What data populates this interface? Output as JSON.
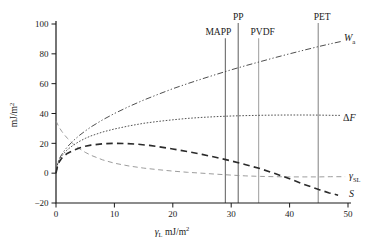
{
  "figure": {
    "background": "#ffffff",
    "axis_color": "#1a1a1a"
  },
  "chart_data": {
    "type": "line",
    "title": "",
    "xlabel": "γL mJ/m2",
    "ylabel": "mJ/m2",
    "xlim": [
      0,
      50
    ],
    "ylim": [
      -20,
      100
    ],
    "grid": false,
    "legend_position": "end-of-curve-labels",
    "x_ticks": {
      "values": [
        0,
        10,
        20,
        30,
        40,
        50
      ],
      "labels": [
        "0",
        "10",
        "20",
        "30",
        "40",
        "50"
      ]
    },
    "y_ticks": {
      "values": [
        100,
        80,
        60,
        40,
        20,
        0,
        -20
      ],
      "labels": [
        "100",
        "80",
        "60",
        "40",
        "20",
        "0",
        "−20"
      ]
    },
    "y_title_parts": [
      {
        "t": "mJ/m",
        "fs": 9.5
      },
      {
        "t": "2",
        "fs": 6.5,
        "dy": -3.5
      }
    ],
    "x_title_parts": [
      {
        "t": "γ",
        "fs": 10,
        "italic": true
      },
      {
        "t": "L",
        "fs": 6.5,
        "dy": 1.5
      },
      {
        "t": " mJ/m",
        "fs": 9.5,
        "dy": -1.5
      },
      {
        "t": "2",
        "fs": 6.5,
        "dy": -4
      }
    ],
    "vertical_lines": [
      {
        "name": "mapp",
        "label": "MAPP",
        "x": 29.0,
        "y_top": 90.5,
        "color": "#6b6b6b",
        "label_dx": -7
      },
      {
        "name": "pp",
        "label": "PP",
        "x": 31.2,
        "y_top": 100.6,
        "color": "#6b6b6b",
        "label_dx": 0
      },
      {
        "name": "pvdf",
        "label": "PVDF",
        "x": 34.7,
        "y_top": 90.5,
        "color": "#a6a6a6",
        "label_dx": 4
      },
      {
        "name": "pet",
        "label": "PET",
        "x": 44.9,
        "y_top": 100.6,
        "color": "#8c8c8c",
        "label_dx": 4
      }
    ],
    "series": [
      {
        "name": "Wa",
        "description": "work of adhesion",
        "color": "#3a3a3a",
        "width": 0.9,
        "dash": "6 2.2 1.3 2.2 1.3 2.2",
        "cap": "butt",
        "label_parts": [
          {
            "t": "W",
            "fs": 10,
            "italic": true
          },
          {
            "t": "a",
            "fs": 7,
            "dy": 2.5
          }
        ],
        "label_x": 344,
        "label_y": 41,
        "points": [
          [
            0,
            0
          ],
          [
            0.3,
            6.9
          ],
          [
            0.6,
            9.8
          ],
          [
            1,
            12.6
          ],
          [
            1.5,
            15.5
          ],
          [
            2,
            17.9
          ],
          [
            3,
            21.9
          ],
          [
            4,
            25.3
          ],
          [
            5,
            28.3
          ],
          [
            6,
            31
          ],
          [
            8,
            35.8
          ],
          [
            10,
            40
          ],
          [
            12.5,
            44.7
          ],
          [
            15,
            49
          ],
          [
            17.5,
            52.9
          ],
          [
            20,
            56.6
          ],
          [
            22.5,
            60
          ],
          [
            25,
            63.2
          ],
          [
            27.5,
            66.3
          ],
          [
            30,
            69.3
          ],
          [
            32.5,
            72.1
          ],
          [
            35,
            74.8
          ],
          [
            37.5,
            77.5
          ],
          [
            40,
            80
          ],
          [
            42.5,
            82.5
          ],
          [
            45,
            84.9
          ],
          [
            47,
            86.7
          ],
          [
            48.8,
            88.3
          ]
        ]
      },
      {
        "name": "ΔF",
        "description": "free energy change",
        "color": "#4a4a4a",
        "width": 0.95,
        "dash": "0.8 2.4",
        "cap": "round",
        "label_parts": [
          {
            "t": "Δ",
            "fs": 10
          },
          {
            "t": "F",
            "fs": 10,
            "italic": true
          }
        ],
        "label_x": 343,
        "label_y": 121,
        "points": [
          [
            0,
            0
          ],
          [
            0.3,
            6.6
          ],
          [
            0.6,
            9.2
          ],
          [
            1,
            11.6
          ],
          [
            1.5,
            14
          ],
          [
            2,
            15.9
          ],
          [
            3,
            18.9
          ],
          [
            4,
            21.3
          ],
          [
            5,
            23.3
          ],
          [
            6,
            25
          ],
          [
            8,
            27.6
          ],
          [
            10,
            29.6
          ],
          [
            12.5,
            31.7
          ],
          [
            15,
            33.4
          ],
          [
            17.5,
            34.7
          ],
          [
            20,
            35.8
          ],
          [
            22.5,
            36.7
          ],
          [
            25,
            37.4
          ],
          [
            27.5,
            37.9
          ],
          [
            30,
            38.3
          ],
          [
            32.5,
            38.6
          ],
          [
            35,
            38.8
          ],
          [
            37.5,
            38.9
          ],
          [
            40,
            39
          ],
          [
            42.5,
            39
          ],
          [
            45,
            38.9
          ],
          [
            47,
            38.8
          ],
          [
            48.8,
            38.7
          ]
        ]
      },
      {
        "name": "γSL",
        "description": "solid-liquid interfacial tension",
        "color": "#8a8a8a",
        "width": 0.85,
        "dash": "5 3.5",
        "cap": "butt",
        "label_parts": [
          {
            "t": "γ",
            "fs": 10,
            "italic": true
          },
          {
            "t": "SL",
            "fs": 6.5,
            "dy": 2.5
          }
        ],
        "label_x": 349,
        "label_y": 179,
        "points": [
          [
            0,
            35
          ],
          [
            0.5,
            31
          ],
          [
            1,
            28
          ],
          [
            1.5,
            25.4
          ],
          [
            2,
            23.2
          ],
          [
            3,
            19.4
          ],
          [
            4,
            16.4
          ],
          [
            5,
            14
          ],
          [
            6,
            12
          ],
          [
            8,
            8.9
          ],
          [
            10,
            6.7
          ],
          [
            12.5,
            4.8
          ],
          [
            15,
            3.4
          ],
          [
            17.5,
            2.3
          ],
          [
            20,
            1.4
          ],
          [
            22.5,
            0.6
          ],
          [
            25,
            0
          ],
          [
            27.5,
            -0.7
          ],
          [
            30,
            -1.3
          ],
          [
            32.5,
            -1.8
          ],
          [
            35,
            -2.2
          ],
          [
            37.5,
            -2.4
          ],
          [
            40,
            -2.5
          ],
          [
            42.5,
            -2.5
          ],
          [
            45,
            -2.5
          ],
          [
            47,
            -2.4
          ],
          [
            49.5,
            -2.4
          ]
        ]
      },
      {
        "name": "S",
        "description": "spreading coefficient",
        "color": "#2b2b2b",
        "width": 1.6,
        "dash": "6.5 4.2",
        "cap": "butt",
        "label_parts": [
          {
            "t": "S",
            "fs": 10,
            "italic": true
          }
        ],
        "label_x": 349,
        "label_y": 197,
        "points": [
          [
            0,
            0
          ],
          [
            0.3,
            5.5
          ],
          [
            0.6,
            7.8
          ],
          [
            1,
            10.1
          ],
          [
            1.5,
            12
          ],
          [
            2,
            13.4
          ],
          [
            3,
            15.4
          ],
          [
            4,
            16.9
          ],
          [
            5,
            18
          ],
          [
            6,
            18.8
          ],
          [
            8,
            19.7
          ],
          [
            10,
            20
          ],
          [
            12,
            19.9
          ],
          [
            14,
            19.4
          ],
          [
            16,
            18.6
          ],
          [
            18,
            17.5
          ],
          [
            20,
            16.2
          ],
          [
            22.5,
            14.5
          ],
          [
            25,
            12.6
          ],
          [
            27.5,
            10.5
          ],
          [
            30,
            8.2
          ],
          [
            32.5,
            5.7
          ],
          [
            35,
            3
          ],
          [
            37.5,
            -0.2
          ],
          [
            40,
            -3.8
          ],
          [
            42.5,
            -7.5
          ],
          [
            45,
            -11
          ],
          [
            46.8,
            -13.2
          ],
          [
            48.3,
            -14.8
          ]
        ]
      }
    ]
  }
}
